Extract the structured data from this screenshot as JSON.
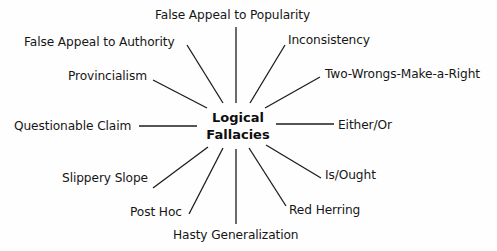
{
  "diagram": {
    "type": "radial-concept-map",
    "center": {
      "line1": "Logical",
      "line2": "Fallacies"
    },
    "nodes": [
      {
        "id": "popularity",
        "label": "False Appeal to Popularity"
      },
      {
        "id": "inconsistency",
        "label": "Inconsistency"
      },
      {
        "id": "two-wrongs",
        "label": "Two-Wrongs-Make-a-Right"
      },
      {
        "id": "either-or",
        "label": "Either/Or"
      },
      {
        "id": "is-ought",
        "label": "Is/Ought"
      },
      {
        "id": "red-herring",
        "label": "Red Herring"
      },
      {
        "id": "hasty-generalization",
        "label": "Hasty Generalization"
      },
      {
        "id": "post-hoc",
        "label": "Post Hoc"
      },
      {
        "id": "slippery-slope",
        "label": "Slippery Slope"
      },
      {
        "id": "questionable-claim",
        "label": "Questionable Claim"
      },
      {
        "id": "provincialism",
        "label": "Provincialism"
      },
      {
        "id": "authority",
        "label": "False Appeal to Authority"
      }
    ],
    "colors": {
      "background": "#fefefe",
      "text": "#161616",
      "lines": "#1c1c1c"
    }
  }
}
